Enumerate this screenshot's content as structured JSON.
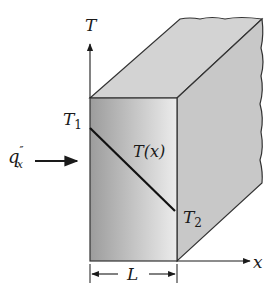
{
  "figure": {
    "type": "plane-wall-conduction",
    "labels": {
      "temp_axis": "T",
      "x_axis": "x",
      "t1": "T",
      "t1_sub": "1",
      "t2": "T",
      "t2_sub": "2",
      "profile": "T(x)",
      "flux_main": "q",
      "flux_sup": "″",
      "flux_sub": "x",
      "thickness": "L"
    },
    "colors": {
      "stroke": "#2b2b2b",
      "front_face_dark": "#9a9a9a",
      "front_face_light": "#e6e6e6",
      "top_face": "#d2d2d2",
      "side_face": "#c6c6c6",
      "background": "#ffffff"
    }
  }
}
